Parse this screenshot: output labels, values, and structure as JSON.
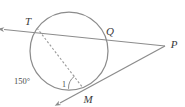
{
  "figure": {
    "type": "circle-secant-tangent-geometry-diagram",
    "background_color": "#ffffff",
    "stroke_color": "#8c8c8c",
    "label_color": "#3a3a3a",
    "points": [
      {
        "id": "T",
        "label": "T",
        "x": 37,
        "y": 28,
        "label_x": 30,
        "label_y": 23,
        "on_circle": true
      },
      {
        "id": "Q",
        "label": "Q",
        "x": 106,
        "y": 36,
        "label_x": 108,
        "label_y": 33,
        "on_circle": true
      },
      {
        "id": "M",
        "label": "M",
        "x": 83,
        "y": 88,
        "label_x": 86,
        "label_y": 101,
        "on_circle": true
      },
      {
        "id": "P",
        "label": "P",
        "x": 165,
        "y": 46,
        "label_x": 170,
        "label_y": 46,
        "on_circle": false
      }
    ],
    "circle": {
      "cx": 69,
      "cy": 51,
      "r": 39
    },
    "arc_measure": {
      "label": "150°",
      "x": 14,
      "y": 82
    },
    "angle_number": {
      "label": "1",
      "x": 65,
      "y": 85
    },
    "segments": [
      {
        "id": "secant-T-Q-P",
        "from": "arrow-left",
        "through": "T,Q",
        "to": "P",
        "style": "solid",
        "arrow_start": true
      },
      {
        "id": "tangent-M-P",
        "from": "arrow-lower-left",
        "through": "M",
        "to": "P",
        "style": "solid",
        "arrow_start": true
      },
      {
        "id": "chord-T-M",
        "from": "T",
        "to": "M",
        "style": "dashed",
        "arrow_start": false
      }
    ]
  }
}
